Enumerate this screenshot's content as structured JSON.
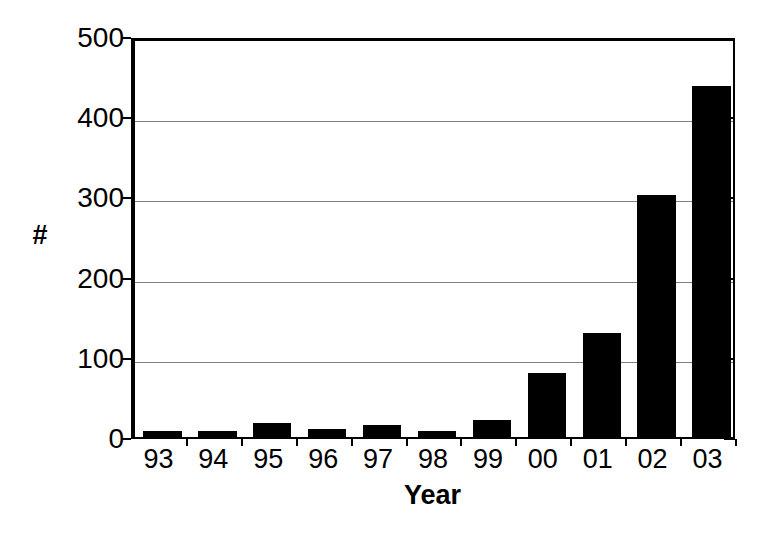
{
  "chart_data": {
    "type": "bar",
    "title": "",
    "xlabel": "Year",
    "ylabel": "#",
    "categories": [
      "93",
      "94",
      "95",
      "96",
      "97",
      "98",
      "99",
      "00",
      "01",
      "02",
      "03"
    ],
    "values": [
      8,
      7,
      18,
      10,
      15,
      7,
      21,
      80,
      130,
      302,
      438
    ],
    "ylim": [
      0,
      500
    ],
    "yticks": [
      0,
      100,
      200,
      300,
      400,
      500
    ],
    "ytick_labels": [
      "0",
      "100",
      "200",
      "300",
      "400",
      "500"
    ],
    "grid": true,
    "grid_axis": "y",
    "legend": null,
    "series_color": "#000000",
    "grid_color": "#808080",
    "axis_color": "#000000",
    "background": "#ffffff"
  }
}
